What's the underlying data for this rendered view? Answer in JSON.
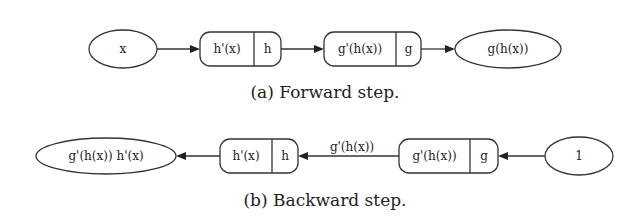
{
  "forward": {
    "caption": "(a) Forward step.",
    "input_node": "x",
    "node_h": {
      "left": "h'(x)",
      "right": "h"
    },
    "node_g": {
      "left": "g'(h(x))",
      "right": "g"
    },
    "output_node": "g(h(x))"
  },
  "backward": {
    "caption": "(b) Backward step.",
    "output_node": "g'(h(x)) h'(x)",
    "node_h": {
      "left": "h'(x)",
      "right": "h"
    },
    "edge_label": "g'(h(x))",
    "node_g": {
      "left": "g'(h(x))",
      "right": "g"
    },
    "input_node": "1"
  }
}
